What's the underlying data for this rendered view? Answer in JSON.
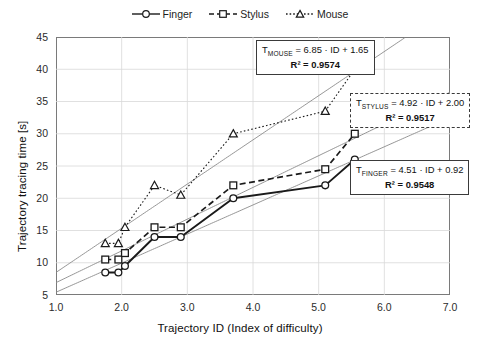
{
  "legend": {
    "items": [
      {
        "label": "Finger",
        "marker": "circle-marker-icon",
        "line": "solid",
        "color": "#1a1a1a"
      },
      {
        "label": "Stylus",
        "marker": "square-marker-icon",
        "line": "dashed",
        "color": "#1a1a1a"
      },
      {
        "label": "Mouse",
        "marker": "triangle-marker-icon",
        "line": "dotted",
        "color": "#1a1a1a"
      }
    ]
  },
  "axes": {
    "x": {
      "title": "Trajectory ID (Index of difficulty)",
      "ticks": [
        "1.0",
        "2.0",
        "3.0",
        "4.0",
        "5.0",
        "6.0",
        "7.0"
      ],
      "min": 1.0,
      "max": 7.0,
      "step": 1.0
    },
    "y": {
      "title": "Trajectory tracing time [s]",
      "ticks": [
        "5",
        "10",
        "15",
        "20",
        "25",
        "30",
        "35",
        "40",
        "45"
      ],
      "min": 5,
      "max": 45,
      "step": 5
    }
  },
  "annotations": [
    {
      "id": "eq-mouse",
      "border": "solid",
      "equation": "T_MOUSE = 6.85 · ID + 1.65",
      "eq_sub": "MOUSE",
      "eq_prefix": "T",
      "eq_rest": " = 6.85 · ID + 1.65",
      "r2_label": "R² = 0.9574",
      "r2_value": 0.9574,
      "slope": 6.85,
      "intercept": 1.65
    },
    {
      "id": "eq-stylus",
      "border": "dashed",
      "equation": "T_STYLUS = 4.92 · ID + 2.00",
      "eq_sub": "STYLUS",
      "eq_prefix": "T",
      "eq_rest": " = 4.92 · ID + 2.00",
      "r2_label": "R² = 0.9517",
      "r2_value": 0.9517,
      "slope": 4.92,
      "intercept": 2.0
    },
    {
      "id": "eq-finger",
      "border": "solid",
      "equation": "T_FINGER = 4.51 · ID + 0.92",
      "eq_sub": "FINGER",
      "eq_prefix": "T",
      "eq_rest": " = 4.51 · ID + 0.92",
      "r2_label": "R² = 0.9548",
      "r2_value": 0.9548,
      "slope": 4.51,
      "intercept": 0.92
    }
  ],
  "chart_data": {
    "type": "line",
    "title": "",
    "xlabel": "Trajectory ID (Index of difficulty)",
    "ylabel": "Trajectory tracing time [s]",
    "xlim": [
      1.0,
      7.0
    ],
    "ylim": [
      5,
      45
    ],
    "grid": true,
    "legend_position": "top-center",
    "x": [
      1.75,
      1.95,
      2.05,
      2.5,
      2.9,
      3.7,
      5.1,
      5.55
    ],
    "series": [
      {
        "name": "Finger",
        "marker": "circle",
        "line": "solid",
        "values": [
          8.5,
          8.5,
          9.5,
          14.0,
          14.0,
          20.0,
          22.0,
          26.0
        ],
        "trendline": {
          "slope": 4.51,
          "intercept": 0.92,
          "r2": 0.9548
        }
      },
      {
        "name": "Stylus",
        "marker": "square",
        "line": "dashed",
        "values": [
          10.5,
          10.5,
          11.5,
          15.5,
          15.5,
          22.0,
          24.5,
          30.0
        ],
        "trendline": {
          "slope": 4.92,
          "intercept": 2.0,
          "r2": 0.9517
        }
      },
      {
        "name": "Mouse",
        "marker": "triangle",
        "line": "dotted",
        "values": [
          13.0,
          13.0,
          15.5,
          22.0,
          20.5,
          30.0,
          33.5,
          40.0
        ],
        "trendline": {
          "slope": 6.85,
          "intercept": 1.65,
          "r2": 0.9574
        }
      }
    ]
  },
  "colors": {
    "ink": "#1a1a1a",
    "frame": "#7a7a7a",
    "grid": "#d8d8d8",
    "trend": "#8a8a8a",
    "background": "#ffffff"
  }
}
